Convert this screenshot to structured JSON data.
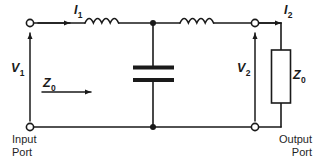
{
  "diagram": {
    "colors": {
      "wire": "#1a1a1a",
      "background": "#ffffff",
      "text": "#1a1a1a"
    },
    "labels": {
      "current_in": {
        "symbol": "I",
        "subscript": "1"
      },
      "current_out": {
        "symbol": "I",
        "subscript": "2"
      },
      "voltage_in": {
        "symbol": "V",
        "subscript": "1"
      },
      "voltage_out": {
        "symbol": "V",
        "subscript": "2"
      },
      "impedance_in": {
        "symbol": "Z",
        "subscript": "0"
      },
      "impedance_load": {
        "symbol": "Z",
        "subscript": "0"
      }
    },
    "ports": {
      "input": {
        "line1": "Input",
        "line2": "Port"
      },
      "output": {
        "line1": "Output",
        "line2": "Port"
      }
    },
    "components": {
      "inductor_1": "inductor-series-left",
      "inductor_2": "inductor-series-right",
      "capacitor": "capacitor-shunt",
      "resistor": "resistor-load"
    }
  }
}
